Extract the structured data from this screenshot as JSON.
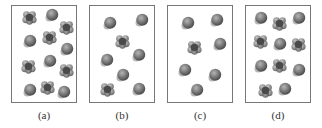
{
  "figure": {
    "panels": [
      {
        "label": "(a)",
        "molecules": [
          {
            "kind": "tetra",
            "col": 0.28,
            "row": 0.12
          },
          {
            "kind": "sphere",
            "col": 0.62,
            "row": 0.1
          },
          {
            "kind": "tetra",
            "col": 0.85,
            "row": 0.22
          },
          {
            "kind": "sphere",
            "col": 0.28,
            "row": 0.37
          },
          {
            "kind": "tetra",
            "col": 0.58,
            "row": 0.33
          },
          {
            "kind": "sphere",
            "col": 0.85,
            "row": 0.45
          },
          {
            "kind": "tetra",
            "col": 0.25,
            "row": 0.63
          },
          {
            "kind": "sphere",
            "col": 0.58,
            "row": 0.58
          },
          {
            "kind": "tetra",
            "col": 0.85,
            "row": 0.67
          },
          {
            "kind": "sphere",
            "col": 0.28,
            "row": 0.88
          },
          {
            "kind": "tetra",
            "col": 0.55,
            "row": 0.85
          },
          {
            "kind": "sphere",
            "col": 0.8,
            "row": 0.9
          }
        ]
      },
      {
        "label": "(b)",
        "molecules": [
          {
            "kind": "sphere",
            "col": 0.3,
            "row": 0.18
          },
          {
            "kind": "sphere",
            "col": 0.8,
            "row": 0.15
          },
          {
            "kind": "tetra",
            "col": 0.5,
            "row": 0.37
          },
          {
            "kind": "sphere",
            "col": 0.25,
            "row": 0.57
          },
          {
            "kind": "sphere",
            "col": 0.75,
            "row": 0.52
          },
          {
            "kind": "sphere",
            "col": 0.5,
            "row": 0.72
          },
          {
            "kind": "tetra",
            "col": 0.28,
            "row": 0.87
          },
          {
            "kind": "sphere",
            "col": 0.75,
            "row": 0.87
          }
        ]
      },
      {
        "label": "(c)",
        "molecules": [
          {
            "kind": "sphere",
            "col": 0.3,
            "row": 0.18
          },
          {
            "kind": "sphere",
            "col": 0.75,
            "row": 0.15
          },
          {
            "kind": "tetra",
            "col": 0.42,
            "row": 0.43
          },
          {
            "kind": "sphere",
            "col": 0.8,
            "row": 0.4
          },
          {
            "kind": "sphere",
            "col": 0.25,
            "row": 0.67
          },
          {
            "kind": "sphere",
            "col": 0.72,
            "row": 0.72
          },
          {
            "kind": "sphere",
            "col": 0.45,
            "row": 0.88
          }
        ]
      },
      {
        "label": "(d)",
        "molecules": [
          {
            "kind": "sphere",
            "col": 0.22,
            "row": 0.13
          },
          {
            "kind": "tetra",
            "col": 0.52,
            "row": 0.18
          },
          {
            "kind": "sphere",
            "col": 0.82,
            "row": 0.13
          },
          {
            "kind": "tetra",
            "col": 0.22,
            "row": 0.37
          },
          {
            "kind": "sphere",
            "col": 0.52,
            "row": 0.4
          },
          {
            "kind": "tetra",
            "col": 0.82,
            "row": 0.4
          },
          {
            "kind": "sphere",
            "col": 0.22,
            "row": 0.63
          },
          {
            "kind": "tetra",
            "col": 0.52,
            "row": 0.62
          },
          {
            "kind": "sphere",
            "col": 0.82,
            "row": 0.67
          },
          {
            "kind": "tetra",
            "col": 0.3,
            "row": 0.88
          },
          {
            "kind": "sphere",
            "col": 0.6,
            "row": 0.87
          }
        ]
      }
    ],
    "colors": {
      "molecule_dark": "#4a4a4a",
      "molecule_mid": "#7a7a7a",
      "molecule_light": "#b5b5b5",
      "border": "#777777",
      "label": "#333333"
    }
  }
}
